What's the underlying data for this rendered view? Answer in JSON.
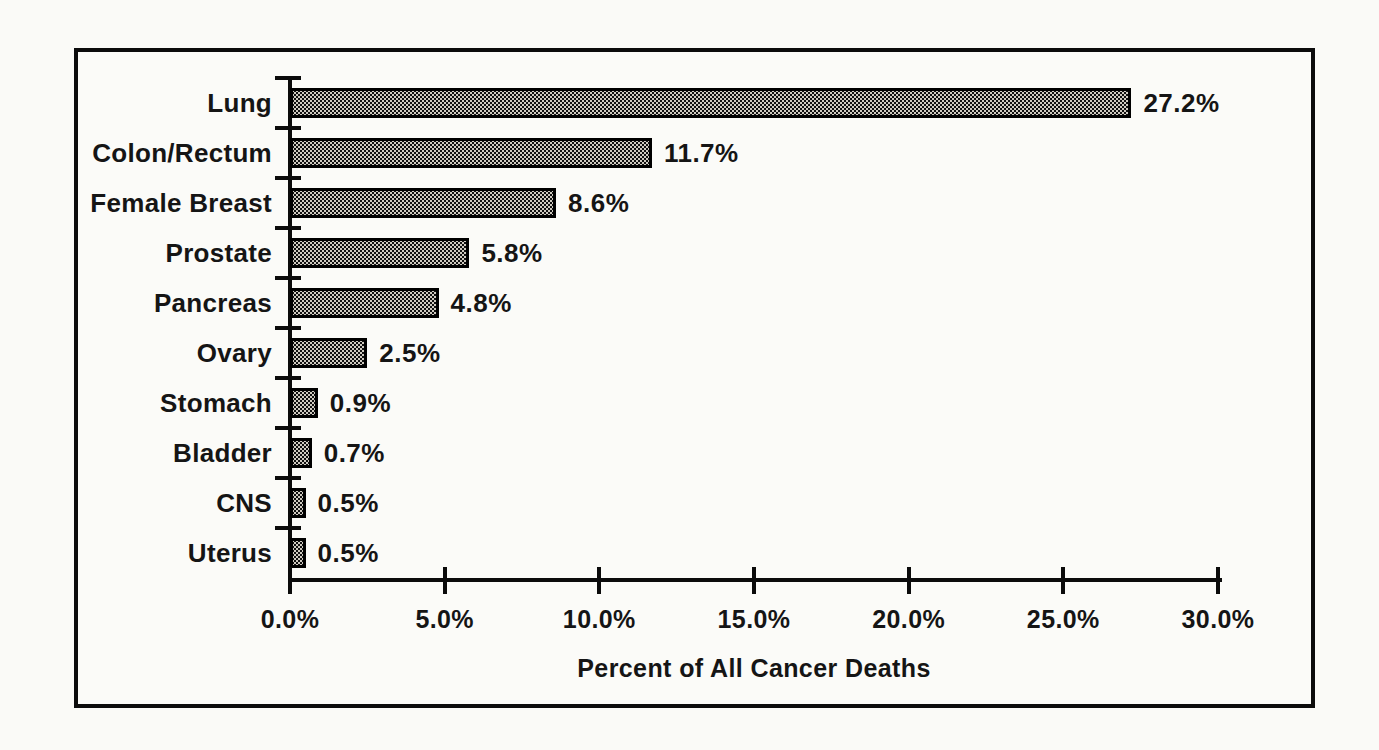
{
  "chart_data": {
    "type": "bar",
    "orientation": "horizontal",
    "title": "",
    "xlabel": "Percent of All Cancer Deaths",
    "ylabel": "",
    "categories": [
      "Lung",
      "Colon/Rectum",
      "Female Breast",
      "Prostate",
      "Pancreas",
      "Ovary",
      "Stomach",
      "Bladder",
      "CNS",
      "Uterus"
    ],
    "values": [
      27.2,
      11.7,
      8.6,
      5.8,
      4.8,
      2.5,
      0.9,
      0.7,
      0.5,
      0.5
    ],
    "value_labels": [
      "27.2%",
      "11.7%",
      "8.6%",
      "5.8%",
      "4.8%",
      "2.5%",
      "0.9%",
      "0.7%",
      "0.5%",
      "0.5%"
    ],
    "xlim": [
      0,
      30
    ],
    "x_ticks": [
      0,
      5,
      10,
      15,
      20,
      25,
      30
    ],
    "x_tick_labels": [
      "0.0%",
      "5.0%",
      "10.0%",
      "15.0%",
      "20.0%",
      "25.0%",
      "30.0%"
    ],
    "grid": false,
    "legend": null,
    "style": {
      "bar_fill": "stippled-halftone",
      "bar_color": "#101010",
      "bar_dot_color": "#cfcac0",
      "bar_border_color": "#000000",
      "frame_color": "#0c0c0c",
      "background_color": "#fbfbf8",
      "text_color": "#151515"
    }
  }
}
